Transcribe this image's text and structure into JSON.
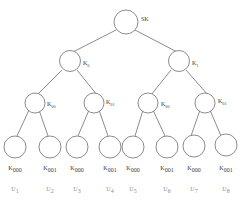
{
  "diagram": {
    "type": "binary-key-tree",
    "background_color": "#ffffff",
    "line_color": "#5a5a5a",
    "text_color": "#3a3a3a",
    "user_text_color": "#8a8a8a",
    "root": {
      "label": "SK",
      "base": "SK",
      "subscript": ""
    },
    "level2": [
      {
        "base": "K",
        "subscript": "0"
      },
      {
        "base": "K",
        "subscript": "1"
      }
    ],
    "level3": [
      {
        "base": "K",
        "subscript": "00"
      },
      {
        "base": "K",
        "subscript": "01"
      },
      {
        "base": "K",
        "subscript": "00"
      },
      {
        "base": "K",
        "subscript": "01"
      }
    ],
    "leaves": [
      {
        "base": "K",
        "subscript": "000",
        "user_base": "U",
        "user_subscript": "1"
      },
      {
        "base": "K",
        "subscript": "001",
        "user_base": "U",
        "user_subscript": "2"
      },
      {
        "base": "K",
        "subscript": "000",
        "user_base": "U",
        "user_subscript": "3"
      },
      {
        "base": "K",
        "subscript": "001",
        "user_base": "U",
        "user_subscript": "4"
      },
      {
        "base": "K",
        "subscript": "000",
        "user_base": "U",
        "user_subscript": "5"
      },
      {
        "base": "K",
        "subscript": "001",
        "user_base": "U",
        "user_subscript": "6"
      },
      {
        "base": "K",
        "subscript": "000",
        "user_base": "U",
        "user_subscript": "7"
      },
      {
        "base": "K",
        "subscript": "001",
        "user_base": "U",
        "user_subscript": "8"
      }
    ]
  }
}
